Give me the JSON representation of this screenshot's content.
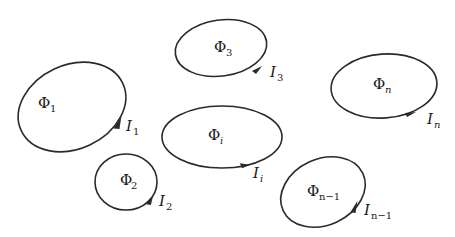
{
  "diagram": {
    "type": "current loops with magnetic flux",
    "loops": [
      {
        "id": "loop-1",
        "flux": "Φ",
        "flux_sub": "1",
        "current": "I",
        "current_sub": "1"
      },
      {
        "id": "loop-2",
        "flux": "Φ",
        "flux_sub": "2",
        "current": "I",
        "current_sub": "2"
      },
      {
        "id": "loop-3",
        "flux": "Φ",
        "flux_sub": "3",
        "current": "I",
        "current_sub": "3"
      },
      {
        "id": "loop-i",
        "flux": "Φ",
        "flux_sub": "i",
        "current": "I",
        "current_sub": "i"
      },
      {
        "id": "loop-n-1",
        "flux": "Φ",
        "flux_sub": "n−1",
        "current": "I",
        "current_sub": "n−1"
      },
      {
        "id": "loop-n",
        "flux": "Φ",
        "flux_sub": "n",
        "current": "I",
        "current_sub": "n"
      }
    ],
    "colors": {
      "stroke": "#2a2a2a",
      "background": "#ffffff"
    }
  }
}
